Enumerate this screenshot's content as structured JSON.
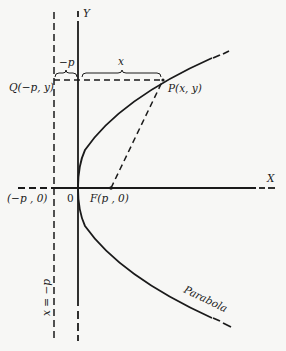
{
  "figure": {
    "background": "#f7f7f5",
    "ink": "#1a1a1a"
  },
  "labels": {
    "y_axis": "Y",
    "x_axis": "X",
    "origin": "0",
    "focus": "F(p , 0)",
    "directrix_point": "(−p , 0)",
    "q_point": "Q(−p, y)",
    "p_point": "P(x, y)",
    "minus_p_brace": "−p",
    "x_brace": "x",
    "directrix_line": "x = −p",
    "curve": "Parabola"
  },
  "geometry": {
    "origin_px": [
      78,
      188
    ],
    "focus_px": [
      111,
      188
    ],
    "directrix_x_px": 54,
    "point_p_px": [
      163,
      80
    ],
    "point_q_px": [
      54,
      80
    ]
  }
}
